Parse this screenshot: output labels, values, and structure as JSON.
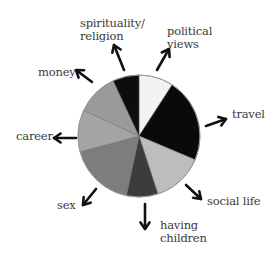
{
  "chart_data": {
    "type": "pie",
    "title": "",
    "note": "Unlabeled pie diagram; slice sizes are visual estimates in degrees (clockwise from 12 o'clock).",
    "center": [
      139,
      136
    ],
    "radius": 61,
    "slices": [
      {
        "name": "political views",
        "start": 0,
        "end": 33,
        "color": "#f2f2f2"
      },
      {
        "name": "travel",
        "start": 33,
        "end": 113,
        "color": "#0a0a0a"
      },
      {
        "name": "social life",
        "start": 113,
        "end": 162,
        "color": "#bdbdbd"
      },
      {
        "name": "having children",
        "start": 162,
        "end": 192,
        "color": "#3c3c3c"
      },
      {
        "name": "sex",
        "start": 192,
        "end": 255,
        "color": "#7d7d7d"
      },
      {
        "name": "career",
        "start": 255,
        "end": 295,
        "color": "#a4a4a4"
      },
      {
        "name": "money",
        "start": 295,
        "end": 335,
        "color": "#9a9a9a"
      },
      {
        "name": "spirituality/religion",
        "start": 335,
        "end": 360,
        "color": "#0d0d0d"
      }
    ],
    "categories": [
      "political views",
      "travel",
      "social life",
      "having children",
      "sex",
      "career",
      "money",
      "spirituality/religion"
    ],
    "values": [
      33,
      80,
      49,
      30,
      63,
      40,
      40,
      25
    ],
    "outline_color": "#9a9a9a",
    "arrow_color": "#111111",
    "legend": "none (labels placed at arrow tips)"
  },
  "labels": {
    "spirituality": [
      "spirituality/",
      "religion"
    ],
    "political": [
      "political",
      "views"
    ],
    "money": [
      "money"
    ],
    "travel": [
      "travel"
    ],
    "career": [
      "career"
    ],
    "social": [
      "social life"
    ],
    "sex": [
      "sex"
    ],
    "children": [
      "having",
      "children"
    ]
  },
  "arrows": [
    {
      "name": "spirituality",
      "x1": 124,
      "y1": 70,
      "x2": 114,
      "y2": 45
    },
    {
      "name": "political",
      "x1": 157,
      "y1": 70,
      "x2": 169,
      "y2": 49
    },
    {
      "name": "money",
      "x1": 92,
      "y1": 82,
      "x2": 76,
      "y2": 70
    },
    {
      "name": "travel",
      "x1": 206,
      "y1": 126,
      "x2": 226,
      "y2": 119
    },
    {
      "name": "career",
      "x1": 76,
      "y1": 138,
      "x2": 54,
      "y2": 138
    },
    {
      "name": "social",
      "x1": 186,
      "y1": 185,
      "x2": 201,
      "y2": 199
    },
    {
      "name": "sex",
      "x1": 96,
      "y1": 189,
      "x2": 83,
      "y2": 205
    },
    {
      "name": "children",
      "x1": 145,
      "y1": 204,
      "x2": 145,
      "y2": 229
    }
  ]
}
